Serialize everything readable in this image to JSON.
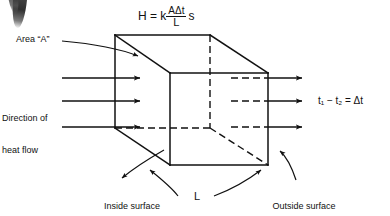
{
  "figure": {
    "background": "#ffffff",
    "ink": "#111111"
  },
  "formula": {
    "lhs": "H = k",
    "numerator": "AΔt",
    "denominator": "L",
    "trailing": "s",
    "full_text": "H = k AΔt / L s"
  },
  "labels": {
    "area": "Area “A”",
    "direction_line1": "Direction of",
    "direction_line2": "heat flow",
    "delta": "t₁ − t₂ = Δt",
    "inside_line1": "Inside surface",
    "inside_line2": "temperature",
    "inside_symbol": "t₁",
    "outside_line1": "Outside surface",
    "outside_line2": "temperature",
    "outside_symbol": "t₂",
    "thickness": "L"
  },
  "diagram_data": {
    "type": "technical-illustration",
    "shape": "cube",
    "cube_vertices": {
      "back_top_left": [
        115,
        35
      ],
      "back_top_right": [
        210,
        35
      ],
      "front_top_left": [
        170,
        73
      ],
      "front_top_right": [
        268,
        73
      ],
      "back_bottom_left": [
        115,
        128
      ],
      "back_bottom_right": [
        210,
        128
      ],
      "front_bottom_left": [
        170,
        165
      ],
      "front_bottom_right": [
        268,
        165
      ]
    },
    "hidden_edges_style": "dashed",
    "flow_arrows_left": [
      {
        "x1": 62,
        "y1": 78,
        "x2": 143,
        "y2": 78
      },
      {
        "x1": 62,
        "y1": 101,
        "x2": 143,
        "y2": 101
      },
      {
        "x1": 62,
        "y1": 127,
        "x2": 143,
        "y2": 127
      }
    ],
    "flow_arrows_right": [
      {
        "x1": 231,
        "y1": 78,
        "x2": 305,
        "y2": 78,
        "dashed_until": 268
      },
      {
        "x1": 231,
        "y1": 101,
        "x2": 305,
        "y2": 101,
        "dashed_until": 268
      },
      {
        "x1": 231,
        "y1": 127,
        "x2": 305,
        "y2": 127,
        "dashed_until": 268
      }
    ],
    "arrow_direction": "left-to-right",
    "leader_lines": [
      {
        "name": "area-leader",
        "from": [
          62,
          43
        ],
        "to": [
          140,
          57
        ]
      },
      {
        "name": "inside-leader",
        "from": [
          163,
          152
        ],
        "to": [
          118,
          180
        ]
      },
      {
        "name": "outside-leader",
        "from": [
          281,
          152
        ],
        "to": [
          300,
          178
        ]
      },
      {
        "name": "length-leader-left",
        "from": [
          182,
          196
        ],
        "to": [
          150,
          170
        ]
      },
      {
        "name": "length-leader-right",
        "from": [
          214,
          196
        ],
        "to": [
          262,
          170
        ]
      }
    ]
  }
}
